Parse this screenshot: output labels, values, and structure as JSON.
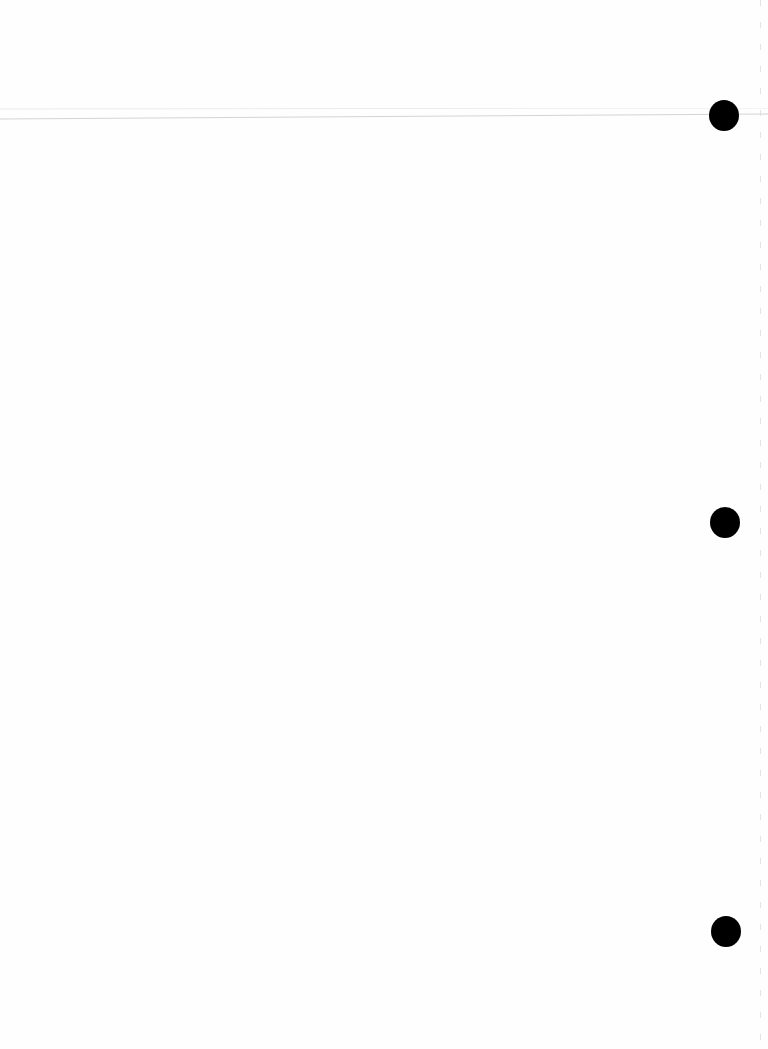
{
  "page": {
    "type": "blank scanned page",
    "background_color": "#fefefe",
    "text": ""
  },
  "punch_holes": [
    {
      "cx": 724,
      "cy": 115,
      "r": 15,
      "color": "#000000"
    },
    {
      "cx": 725,
      "cy": 522,
      "r": 15,
      "color": "#000000"
    },
    {
      "cx": 726,
      "cy": 931,
      "r": 15,
      "color": "#000000"
    }
  ],
  "artifacts": {
    "scan_line_color": "#d0d0d0",
    "edge_line_color": "#d8d8d8"
  }
}
